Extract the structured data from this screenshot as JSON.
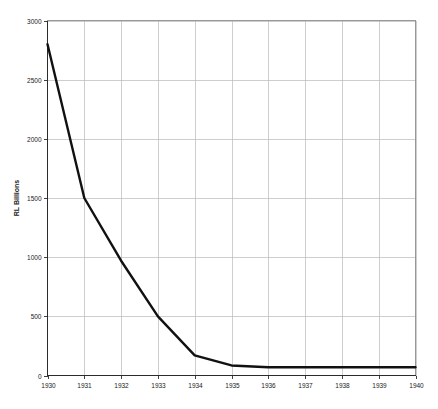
{
  "chart_data": {
    "type": "line",
    "title": "",
    "subtitle": "",
    "xlabel": "",
    "ylabel": "RL Billions",
    "categories": [
      "1930",
      "1931",
      "1932",
      "1933",
      "1934",
      "1935",
      "1936",
      "1937",
      "1938",
      "1939",
      "1940"
    ],
    "x": [
      1930,
      1931,
      1932,
      1933,
      1934,
      1935,
      1936,
      1937,
      1938,
      1939,
      1940
    ],
    "values": [
      2800,
      1500,
      970,
      500,
      170,
      85,
      70,
      70,
      70,
      70,
      70
    ],
    "series": [
      {
        "name": "RL Billions",
        "values": [
          2800,
          1500,
          970,
          500,
          170,
          85,
          70,
          70,
          70,
          70,
          70
        ]
      }
    ],
    "xlim": [
      1930,
      1940
    ],
    "ylim": [
      0,
      3000
    ],
    "ytick_values": [
      0,
      500,
      1000,
      1500,
      2000,
      2500,
      3000
    ],
    "ytick_labels": [
      "0",
      "500",
      "1000",
      "1500",
      "2000",
      "2500",
      "3000"
    ],
    "xtick_values": [
      1930,
      1931,
      1932,
      1933,
      1934,
      1935,
      1936,
      1937,
      1938,
      1939,
      1940
    ],
    "xtick_labels": [
      "1930",
      "1931",
      "1932",
      "1933",
      "1934",
      "1935",
      "1936",
      "1937",
      "1938",
      "1939",
      "1940"
    ],
    "grid": true,
    "grid_axes": "both",
    "legend": false,
    "legend_position": "none",
    "annotations": [],
    "line_color": "#111111",
    "grid_color": "#b9b9b9",
    "background_color": "#ffffff",
    "axis_color": "#2b2b2b"
  }
}
